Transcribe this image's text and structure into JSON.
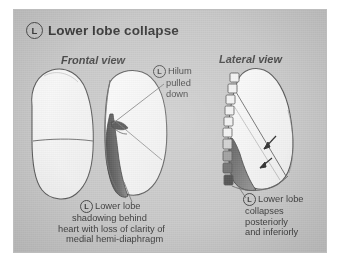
{
  "figure": {
    "background_color": "#c9c9c9",
    "ink_color": "#3f3f3f",
    "title": {
      "marker": "L",
      "text": "Lower lobe collapse"
    },
    "views": [
      {
        "id": "frontal",
        "label": "Frontal view"
      },
      {
        "id": "lateral",
        "label": "Lateral view"
      }
    ],
    "callouts": [
      {
        "id": "hilum",
        "marker": "L",
        "lines": [
          "Hilum",
          "pulled",
          "down"
        ]
      },
      {
        "id": "frontal-caption",
        "marker": "L",
        "lines": [
          "Lower lobe",
          "shadowing behind",
          "heart with loss of clarity of",
          "medial hemi-diaphragm"
        ]
      },
      {
        "id": "lateral-caption",
        "marker": "L",
        "lines": [
          "Lower lobe",
          "collapses",
          "posteriorly",
          "and inferiorly"
        ]
      }
    ],
    "anatomy": {
      "frontal": {
        "right_lung": "right lung outline with horizontal fissure",
        "left_lung": "left lung outline with collapsed lower lobe",
        "collapse_shading": "dark medial wedge behind heart border"
      },
      "lateral": {
        "vertebral_bodies": "stacked vertebral body rectangles",
        "oblique_fissure": "oblique fissure line",
        "collapse_shading": "dark posterior-inferior triangular opacity",
        "arrow_count": 2
      }
    }
  }
}
